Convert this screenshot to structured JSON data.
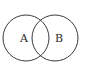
{
  "diagram": {
    "type": "venn",
    "sets": [
      {
        "label": "A",
        "cx": 26,
        "cy": 38,
        "r": 23
      },
      {
        "label": "B",
        "cx": 55,
        "cy": 38,
        "r": 23
      }
    ],
    "stroke_color": "#3a3a3a",
    "background": "#ffffff"
  }
}
